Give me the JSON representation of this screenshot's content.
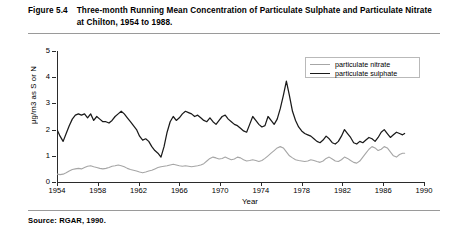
{
  "figure": {
    "number": "Figure 5.4",
    "title": "Three-month Running Mean Concentration of Particulate Sulphate and Particulate Nitrate at Chilton, 1954 to 1988.",
    "source": "Source: RGAR, 1990."
  },
  "colors": {
    "sulphate": "#1a1a1a",
    "nitrate": "#a6a6a6",
    "axis": "#2b2b2b",
    "rule": "#9a9a9a",
    "legend_border": "#b9b9b9",
    "background": "#ffffff"
  },
  "legend": {
    "position": "top-right",
    "entries": [
      {
        "label": "particulate nitrate",
        "color": "#a6a6a6"
      },
      {
        "label": "particulate sulphate",
        "color": "#1a1a1a"
      }
    ]
  },
  "chart_data": {
    "type": "line",
    "title": "Three-month Running Mean Concentration of Particulate Sulphate and Particulate Nitrate at Chilton, 1954 to 1988.",
    "xlabel": "Year",
    "ylabel": "µg/m3 as S or N",
    "xlim": [
      1954,
      1990
    ],
    "ylim": [
      0,
      5
    ],
    "xticks": [
      1954,
      1958,
      1962,
      1966,
      1970,
      1974,
      1978,
      1982,
      1986,
      1990
    ],
    "yticks": [
      0,
      1,
      2,
      3,
      4,
      5
    ],
    "grid": false,
    "legend_position": "top-right",
    "series": [
      {
        "name": "particulate sulphate",
        "color": "#1a1a1a",
        "x": [
          1954.0,
          1954.3,
          1954.6,
          1954.9,
          1955.2,
          1955.5,
          1955.8,
          1956.1,
          1956.4,
          1956.7,
          1957.0,
          1957.3,
          1957.6,
          1957.9,
          1958.2,
          1958.5,
          1958.8,
          1959.1,
          1959.4,
          1959.7,
          1960.0,
          1960.3,
          1960.6,
          1960.9,
          1961.2,
          1961.5,
          1961.8,
          1962.1,
          1962.4,
          1962.7,
          1963.0,
          1963.3,
          1963.6,
          1963.9,
          1964.2,
          1964.5,
          1964.8,
          1965.1,
          1965.4,
          1965.7,
          1966.0,
          1966.3,
          1966.6,
          1966.9,
          1967.2,
          1967.5,
          1967.8,
          1968.1,
          1968.4,
          1968.7,
          1969.0,
          1969.3,
          1969.6,
          1969.9,
          1970.2,
          1970.5,
          1970.8,
          1971.1,
          1971.4,
          1971.7,
          1972.0,
          1972.3,
          1972.6,
          1972.9,
          1973.2,
          1973.5,
          1973.8,
          1974.1,
          1974.4,
          1974.7,
          1975.0,
          1975.3,
          1975.6,
          1975.9,
          1976.2,
          1976.5,
          1976.8,
          1977.1,
          1977.4,
          1977.7,
          1978.0,
          1978.3,
          1978.6,
          1978.9,
          1979.2,
          1979.5,
          1979.8,
          1980.1,
          1980.4,
          1980.7,
          1981.0,
          1981.3,
          1981.6,
          1981.9,
          1982.2,
          1982.5,
          1982.8,
          1983.1,
          1983.4,
          1983.7,
          1984.0,
          1984.3,
          1984.6,
          1984.9,
          1985.2,
          1985.5,
          1985.8,
          1986.1,
          1986.4,
          1986.7,
          1987.0,
          1987.3,
          1987.6,
          1987.9,
          1988.1
        ],
        "y": [
          2.0,
          1.75,
          1.55,
          1.85,
          2.15,
          2.4,
          2.55,
          2.6,
          2.55,
          2.6,
          2.45,
          2.6,
          2.35,
          2.5,
          2.4,
          2.3,
          2.3,
          2.25,
          2.35,
          2.5,
          2.6,
          2.7,
          2.6,
          2.45,
          2.3,
          2.15,
          2.0,
          1.75,
          1.6,
          1.65,
          1.55,
          1.35,
          1.2,
          1.1,
          0.95,
          1.35,
          1.9,
          2.3,
          2.5,
          2.35,
          2.45,
          2.6,
          2.7,
          2.65,
          2.6,
          2.5,
          2.55,
          2.45,
          2.35,
          2.3,
          2.45,
          2.3,
          2.2,
          2.35,
          2.5,
          2.55,
          2.4,
          2.3,
          2.2,
          2.15,
          2.05,
          1.95,
          1.9,
          2.2,
          2.5,
          2.35,
          2.2,
          2.1,
          2.15,
          2.5,
          2.35,
          2.2,
          2.4,
          2.8,
          3.3,
          3.85,
          3.3,
          2.7,
          2.35,
          2.1,
          1.95,
          1.85,
          1.8,
          1.75,
          1.65,
          1.55,
          1.5,
          1.6,
          1.75,
          1.65,
          1.5,
          1.45,
          1.55,
          1.75,
          2.0,
          1.85,
          1.7,
          1.5,
          1.45,
          1.55,
          1.5,
          1.6,
          1.7,
          1.65,
          1.55,
          1.7,
          1.9,
          2.0,
          1.85,
          1.7,
          1.8,
          1.9,
          1.85,
          1.8,
          1.85
        ]
      },
      {
        "name": "particulate nitrate",
        "color": "#a6a6a6",
        "x": [
          1954.0,
          1954.3,
          1954.6,
          1954.9,
          1955.2,
          1955.5,
          1955.8,
          1956.1,
          1956.4,
          1956.7,
          1957.0,
          1957.3,
          1957.6,
          1957.9,
          1958.2,
          1958.5,
          1958.8,
          1959.1,
          1959.4,
          1959.7,
          1960.0,
          1960.3,
          1960.6,
          1960.9,
          1961.2,
          1961.5,
          1961.8,
          1962.1,
          1962.4,
          1962.7,
          1963.0,
          1963.3,
          1963.6,
          1963.9,
          1964.2,
          1964.5,
          1964.8,
          1965.1,
          1965.4,
          1965.7,
          1966.0,
          1966.3,
          1966.6,
          1966.9,
          1967.2,
          1967.5,
          1967.8,
          1968.1,
          1968.4,
          1968.7,
          1969.0,
          1969.3,
          1969.6,
          1969.9,
          1970.2,
          1970.5,
          1970.8,
          1971.1,
          1971.4,
          1971.7,
          1972.0,
          1972.3,
          1972.6,
          1972.9,
          1973.2,
          1973.5,
          1973.8,
          1974.1,
          1974.4,
          1974.7,
          1975.0,
          1975.3,
          1975.6,
          1975.9,
          1976.2,
          1976.5,
          1976.8,
          1977.1,
          1977.4,
          1977.7,
          1978.0,
          1978.3,
          1978.6,
          1978.9,
          1979.2,
          1979.5,
          1979.8,
          1980.1,
          1980.4,
          1980.7,
          1981.0,
          1981.3,
          1981.6,
          1981.9,
          1982.2,
          1982.5,
          1982.8,
          1983.1,
          1983.4,
          1983.7,
          1984.0,
          1984.3,
          1984.6,
          1984.9,
          1985.2,
          1985.5,
          1985.8,
          1986.1,
          1986.4,
          1986.7,
          1987.0,
          1987.3,
          1987.6,
          1987.9,
          1988.1
        ],
        "y": [
          0.3,
          0.28,
          0.3,
          0.35,
          0.42,
          0.48,
          0.5,
          0.52,
          0.5,
          0.55,
          0.6,
          0.62,
          0.58,
          0.55,
          0.52,
          0.5,
          0.52,
          0.55,
          0.6,
          0.62,
          0.65,
          0.62,
          0.58,
          0.52,
          0.48,
          0.45,
          0.42,
          0.38,
          0.35,
          0.38,
          0.42,
          0.45,
          0.5,
          0.55,
          0.58,
          0.6,
          0.62,
          0.65,
          0.68,
          0.65,
          0.62,
          0.6,
          0.62,
          0.6,
          0.58,
          0.6,
          0.62,
          0.65,
          0.7,
          0.8,
          0.9,
          0.95,
          0.92,
          0.88,
          0.9,
          0.95,
          0.9,
          0.85,
          0.88,
          0.95,
          0.92,
          0.85,
          0.8,
          0.82,
          0.85,
          0.82,
          0.78,
          0.82,
          0.9,
          1.0,
          1.1,
          1.2,
          1.3,
          1.35,
          1.3,
          1.15,
          1.0,
          0.92,
          0.85,
          0.82,
          0.8,
          0.78,
          0.8,
          0.85,
          0.82,
          0.78,
          0.75,
          0.8,
          0.9,
          0.95,
          0.88,
          0.8,
          0.78,
          0.85,
          0.95,
          0.9,
          0.82,
          0.75,
          0.72,
          0.8,
          0.95,
          1.1,
          1.25,
          1.35,
          1.3,
          1.2,
          1.25,
          1.35,
          1.3,
          1.15,
          1.0,
          0.95,
          1.05,
          1.1,
          1.1
        ]
      }
    ]
  }
}
